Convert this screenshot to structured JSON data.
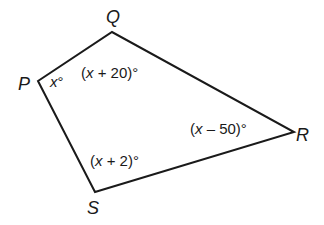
{
  "figure": {
    "type": "quadrilateral",
    "stroke_color": "#1a1a1a",
    "vertices": [
      {
        "name": "P",
        "x": 38,
        "y": 81
      },
      {
        "name": "Q",
        "x": 112,
        "y": 32
      },
      {
        "name": "R",
        "x": 294,
        "y": 132
      },
      {
        "name": "S",
        "x": 95,
        "y": 192
      }
    ],
    "vertex_labels": {
      "P": "P",
      "Q": "Q",
      "R": "R",
      "S": "S"
    },
    "angles": {
      "P": {
        "var": "x",
        "rest": "°"
      },
      "Q": {
        "open": "(",
        "var": "x",
        "rest": " + 20)°"
      },
      "R": {
        "open": "(",
        "var": "x",
        "rest": " – 50)°"
      },
      "S": {
        "open": "(",
        "var": "x",
        "rest": " + 2)°"
      }
    }
  }
}
